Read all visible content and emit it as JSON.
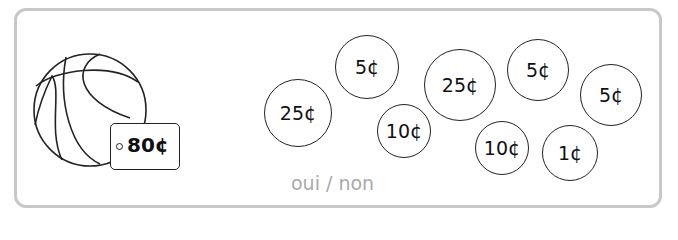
{
  "item": {
    "name": "basketball",
    "price_label": "80¢"
  },
  "coins": [
    {
      "label": "25¢",
      "cx": 298,
      "cy": 113,
      "r": 34
    },
    {
      "label": "5¢",
      "cx": 367,
      "cy": 67,
      "r": 32
    },
    {
      "label": "10¢",
      "cx": 404,
      "cy": 131,
      "r": 27
    },
    {
      "label": "25¢",
      "cx": 460,
      "cy": 85,
      "r": 36
    },
    {
      "label": "5¢",
      "cx": 538,
      "cy": 70,
      "r": 31
    },
    {
      "label": "5¢",
      "cx": 611,
      "cy": 95,
      "r": 31
    },
    {
      "label": "10¢",
      "cx": 502,
      "cy": 148,
      "r": 27
    },
    {
      "label": "1¢",
      "cx": 570,
      "cy": 153,
      "r": 28
    }
  ],
  "answer_text": "oui / non"
}
